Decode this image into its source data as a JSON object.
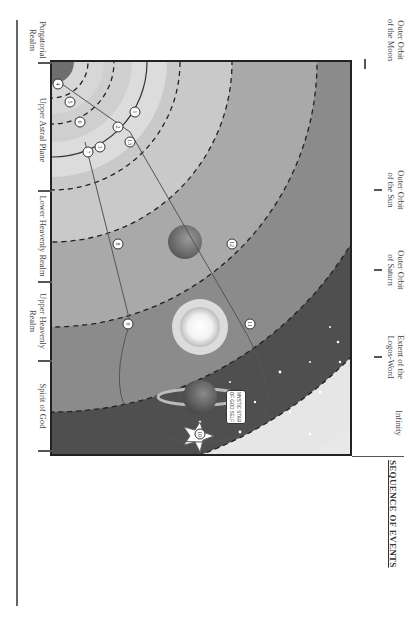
{
  "top_labels": [
    {
      "text": "Outer Orbit of the Moon",
      "lines": [
        "Outer Orbit",
        "of the Moon"
      ]
    },
    {
      "text": "Outer Orbit of the Sun",
      "lines": [
        "Outer Orbit",
        "of the Sun"
      ]
    },
    {
      "text": "Outer Orbit of Saturn",
      "lines": [
        "Outer Orbit",
        "of Saturn"
      ]
    },
    {
      "text": "Extent of the Logos-Word",
      "lines": [
        "Extent of the",
        "Logos-Word"
      ]
    },
    {
      "text": "Infinity",
      "lines": [
        "Infinity"
      ]
    }
  ],
  "left_labels": [
    {
      "lines": [
        "Purgatorial",
        "Realm"
      ]
    },
    {
      "lines": [
        "The Great",
        "Abyss"
      ]
    },
    {
      "lines": [
        "Interior of",
        "the Earth"
      ]
    },
    {
      "lines": [
        "Core"
      ]
    },
    {
      "lines": [
        "Subterranean",
        "Astral Realm"
      ]
    },
    {
      "lines": [
        "Etheric",
        "Sphere"
      ]
    },
    {
      "lines": [
        "Lower Astral",
        "Plane"
      ]
    }
  ],
  "realms": [
    "Upper Astral Plane",
    "Lower Heavenly Realm",
    "Upper Heavenly Realm",
    "Spirit of God"
  ],
  "diagram": {
    "star_label_line1": "MYSTIC STAR",
    "star_label_line2": "OF GOD SELF",
    "markers": [
      "1",
      "2",
      "3",
      "4",
      "5",
      "6",
      "7",
      "8",
      "9",
      "10",
      "11",
      "12",
      "13"
    ]
  },
  "events": {
    "title": "SEQUENCE OF EVENTS",
    "items": [
      {
        "num": "1",
        "lines": [
          "The Mystic Death"
        ]
      },
      {
        "num": "2",
        "lines": [
          "Crossed the Great Abyss"
        ]
      },
      {
        "num": "3",
        "lines": [
          "Descended into Hell"
        ]
      },
      {
        "num": "4",
        "lines": [
          "Transformed Evil Matter"
        ]
      },
      {
        "num": "5",
        "lines": [
          "Discarded Phantom Body",
          "(retained extract)"
        ]
      },
      {
        "num": "6",
        "lines": [
          "Ascended from Hell"
        ]
      },
      {
        "num": "7",
        "lines": [
          "Discarded Etheric Body",
          "(retained extract)"
        ]
      },
      {
        "num": "8",
        "lines": [
          "Discarded Astral Body",
          "(retained extract)"
        ]
      },
      {
        "num": "9",
        "lines": [
          "Discarded Ego-Bearing",
          "Soul (retained extract)"
        ]
      },
      {
        "num": "10",
        "lines": [
          "Cosmic Midnight"
        ]
      },
      {
        "num": "11",
        "lines": [
          "Reunited With Ego-",
          "Bearing Soul"
        ]
      },
      {
        "num": "12",
        "lines": [
          "Reunited With Astral",
          "Body"
        ]
      },
      {
        "num": "13",
        "lines": [
          "Reunited with Phantom",
          "and Etheric Bodies"
        ]
      },
      {
        "num": "",
        "lines": [
          "Completed Formation",
          "of Resurrection Bodies"
        ]
      }
    ]
  },
  "colors": {
    "frame": "#222222",
    "dark_band": "#5a5a5a",
    "light_band": "#d0d0d0",
    "text": "#444444"
  }
}
